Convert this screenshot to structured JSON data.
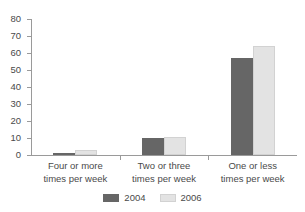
{
  "chart_data": {
    "type": "bar",
    "title": "",
    "subtitle": "",
    "xlabel": "",
    "ylabel": "",
    "ylim": [
      0,
      80
    ],
    "yticks": [
      0,
      10,
      20,
      30,
      40,
      50,
      60,
      70,
      80
    ],
    "grid": false,
    "legend_position": "bottom",
    "categories": [
      "Four or more times per week",
      "Two or three times per week",
      "One or less times per week"
    ],
    "category_lines": [
      [
        "Four or more",
        "times per week"
      ],
      [
        "Two or three",
        "times per week"
      ],
      [
        "One or less",
        "times per week"
      ]
    ],
    "series": [
      {
        "name": "2004",
        "color": "#666666",
        "values": [
          1,
          10,
          57
        ]
      },
      {
        "name": "2006",
        "color": "#e3e3e3",
        "values": [
          3,
          10.5,
          64
        ]
      }
    ]
  },
  "legend": {
    "items": [
      {
        "label": "2004"
      },
      {
        "label": "2006"
      }
    ]
  },
  "axis": {
    "y_tick_labels": [
      "80",
      "70",
      "60",
      "50",
      "40",
      "30",
      "20",
      "10",
      "0"
    ]
  }
}
